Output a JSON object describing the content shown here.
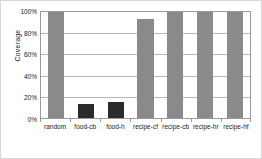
{
  "chart_data": {
    "type": "bar",
    "title": "",
    "xlabel": "",
    "ylabel": "Coverage",
    "categories": [
      "random",
      "food-cb",
      "food-h",
      "recipe-cf",
      "recipe-cb",
      "recipe-hr",
      "recipe-hf"
    ],
    "values": [
      100,
      13,
      15,
      93,
      100,
      100,
      100
    ],
    "value_labels": [
      "100%",
      "13%",
      "15%",
      "93%",
      "100%",
      "100%",
      "100%"
    ],
    "bar_colors": [
      "#8a8a8a",
      "#2a2a2a",
      "#2a2a2a",
      "#8a8a8a",
      "#8a8a8a",
      "#8a8a8a",
      "#8a8a8a"
    ],
    "ylim": [
      0,
      100
    ],
    "ytick_values": [
      0,
      20,
      40,
      60,
      80,
      100
    ],
    "ytick_labels": [
      "0%",
      "20%",
      "40%",
      "60%",
      "80%",
      "100%"
    ],
    "grid": true,
    "grid_axis": "y",
    "legend": null,
    "legend_position": "none",
    "axis_color": "#9a9a9a",
    "gridline_color": "#b6b6b6",
    "text_color": "#1a1a1a",
    "background": "#ffffff"
  }
}
